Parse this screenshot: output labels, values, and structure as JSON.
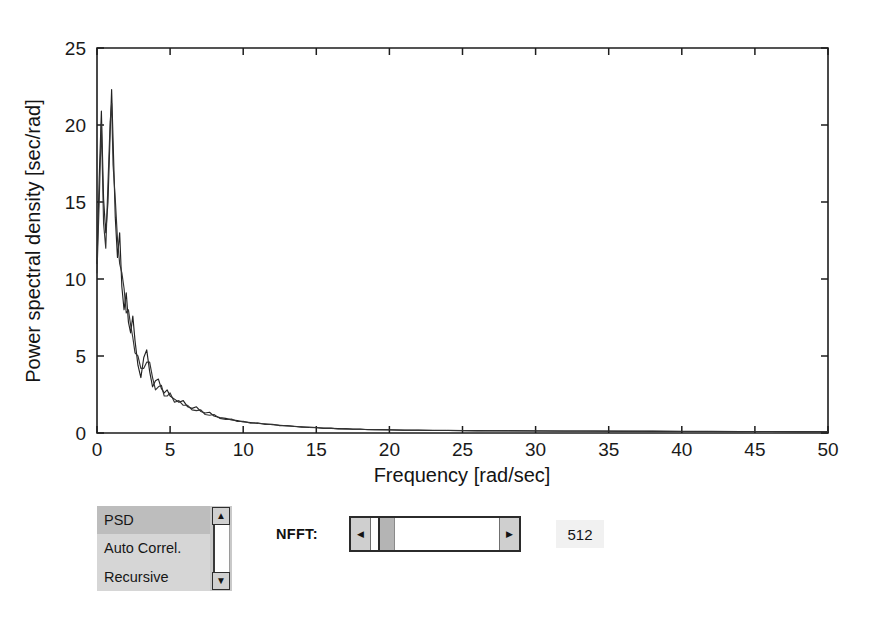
{
  "chart_data": {
    "type": "line",
    "title": "",
    "xlabel": "Frequency [rad/sec]",
    "ylabel": "Power spectral density [sec/rad]",
    "xlim": [
      0,
      50
    ],
    "ylim": [
      0,
      25
    ],
    "xticks": [
      0,
      5,
      10,
      15,
      20,
      25,
      30,
      35,
      40,
      45,
      50
    ],
    "yticks": [
      0,
      5,
      10,
      15,
      20,
      25
    ],
    "xtick_labels": [
      "0",
      "5",
      "10",
      "15",
      "20",
      "25",
      "30",
      "35",
      "40",
      "45",
      "50"
    ],
    "ytick_labels": [
      "0",
      "5",
      "10",
      "15",
      "20",
      "25"
    ],
    "grid": false,
    "legend": "none",
    "series": [
      {
        "name": "PSD estimate A",
        "color": "#222222",
        "x": [
          0.0,
          0.15,
          0.3,
          0.45,
          0.6,
          0.75,
          0.9,
          1.0,
          1.1,
          1.25,
          1.4,
          1.55,
          1.7,
          1.85,
          2.0,
          2.15,
          2.3,
          2.45,
          2.6,
          2.8,
          3.0,
          3.2,
          3.4,
          3.6,
          3.8,
          4.0,
          4.2,
          4.4,
          4.6,
          4.8,
          5.0,
          5.3,
          5.6,
          5.9,
          6.2,
          6.5,
          6.8,
          7.1,
          7.4,
          7.7,
          8.0,
          8.4,
          8.8,
          9.2,
          9.6,
          10.0,
          10.5,
          11.0,
          11.5,
          12.0,
          12.5,
          13.0,
          13.5,
          14.0,
          14.5,
          15.0,
          15.5,
          16.0,
          16.5,
          17.0,
          17.5,
          18.0,
          18.5,
          19.0,
          20.0,
          21.0,
          22.0,
          23.0,
          24.0,
          26.0,
          28.0,
          30.0,
          32.0,
          34.0,
          36.0,
          38.0,
          40.0,
          42.0,
          44.0,
          46.0,
          48.0,
          50.0
        ],
        "y": [
          11.0,
          16.5,
          20.9,
          15.2,
          13.0,
          15.0,
          19.5,
          22.3,
          19.0,
          14.0,
          11.4,
          13.0,
          9.5,
          8.0,
          9.1,
          7.2,
          6.5,
          7.6,
          6.0,
          4.4,
          3.6,
          4.9,
          5.4,
          4.0,
          3.0,
          3.4,
          3.5,
          2.9,
          2.6,
          2.8,
          2.4,
          2.2,
          2.0,
          2.1,
          1.7,
          1.6,
          1.7,
          1.4,
          1.3,
          1.35,
          1.1,
          1.0,
          0.95,
          0.85,
          0.8,
          0.72,
          0.68,
          0.62,
          0.6,
          0.54,
          0.5,
          0.46,
          0.42,
          0.4,
          0.36,
          0.34,
          0.32,
          0.3,
          0.28,
          0.27,
          0.25,
          0.24,
          0.23,
          0.22,
          0.2,
          0.19,
          0.18,
          0.17,
          0.16,
          0.15,
          0.14,
          0.13,
          0.13,
          0.12,
          0.12,
          0.11,
          0.11,
          0.1,
          0.1,
          0.1,
          0.09,
          0.09
        ]
      },
      {
        "name": "PSD estimate B",
        "color": "#333333",
        "x": [
          0.0,
          0.15,
          0.3,
          0.45,
          0.6,
          0.75,
          0.9,
          1.0,
          1.1,
          1.25,
          1.4,
          1.55,
          1.7,
          1.85,
          2.0,
          2.15,
          2.3,
          2.45,
          2.6,
          2.8,
          3.0,
          3.2,
          3.4,
          3.6,
          3.8,
          4.0,
          4.2,
          4.4,
          4.6,
          4.8,
          5.0,
          5.3,
          5.6,
          5.9,
          6.2,
          6.5,
          6.8,
          7.1,
          7.4,
          7.7,
          8.0,
          8.4,
          8.8,
          9.2,
          9.6,
          10.0,
          10.5,
          11.0,
          11.5,
          12.0,
          12.5,
          13.0,
          13.5,
          14.0,
          14.5,
          15.0,
          15.5,
          16.0,
          16.5,
          17.0,
          17.5,
          18.0,
          18.5,
          19.0,
          20.0,
          21.0,
          22.0,
          23.0,
          24.0,
          26.0,
          28.0,
          30.0,
          32.0,
          34.0,
          36.0,
          38.0,
          40.0,
          42.0,
          44.0,
          46.0,
          48.0,
          50.0
        ],
        "y": [
          10.4,
          15.0,
          20.1,
          13.6,
          12.0,
          16.2,
          20.2,
          21.4,
          17.4,
          15.2,
          12.6,
          11.0,
          10.4,
          9.4,
          7.8,
          8.0,
          7.0,
          6.2,
          5.2,
          5.0,
          4.2,
          4.2,
          4.6,
          4.6,
          3.6,
          2.8,
          3.0,
          3.1,
          2.4,
          2.4,
          2.6,
          2.0,
          2.1,
          1.8,
          1.8,
          1.5,
          1.45,
          1.5,
          1.2,
          1.15,
          1.2,
          0.95,
          0.88,
          0.9,
          0.75,
          0.76,
          0.64,
          0.66,
          0.55,
          0.57,
          0.48,
          0.49,
          0.44,
          0.38,
          0.38,
          0.36,
          0.3,
          0.32,
          0.26,
          0.28,
          0.24,
          0.26,
          0.21,
          0.23,
          0.21,
          0.18,
          0.19,
          0.16,
          0.17,
          0.14,
          0.15,
          0.14,
          0.12,
          0.13,
          0.11,
          0.12,
          0.1,
          0.11,
          0.09,
          0.1,
          0.09,
          0.09
        ]
      }
    ]
  },
  "controls": {
    "listbox": {
      "name": "method-listbox",
      "items": [
        "PSD",
        "Auto Correl.",
        "Recursive"
      ],
      "selected_index": 0,
      "scroll_up_icon": "▲",
      "scroll_down_icon": "▼"
    },
    "nfft": {
      "label": "NFFT:",
      "value": "512",
      "slider_left_icon": "◀",
      "slider_right_icon": "▶"
    }
  }
}
